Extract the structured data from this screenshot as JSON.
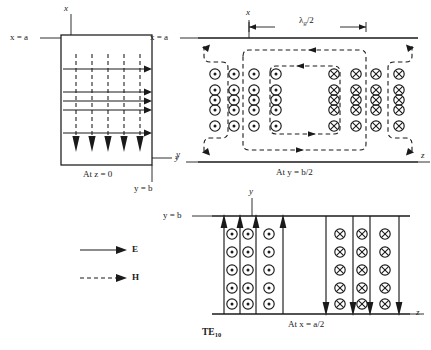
{
  "figure": {
    "mode_label": "TE",
    "mode_sub": "10",
    "legend": [
      {
        "symbol": "solid-arrow",
        "label": "E"
      },
      {
        "symbol": "dashed-arrow",
        "label": "H"
      }
    ]
  },
  "panels": [
    {
      "id": "panel-xy-z0",
      "caption_prefix": "At ",
      "caption_var": "z",
      "caption_eq": " = 0",
      "axis_top": "x",
      "axis_right": "y",
      "wall_label_var": "x",
      "wall_label_eq": " = a",
      "corner_label_var": "y",
      "corner_label_eq": " = b",
      "e_line_count": 5,
      "h_line_count": 5
    },
    {
      "id": "panel-xz-yhalf",
      "caption_prefix": "At ",
      "caption_var": "y",
      "caption_eq": " = b/2",
      "axis_top": "x",
      "axis_left": "y",
      "axis_right": "z",
      "wall_label_var": "x",
      "wall_label_eq": " = a",
      "dimension_label": "λ",
      "dimension_sub": "g",
      "dimension_suffix": "/2",
      "dot_columns": 4,
      "cross_columns": 4,
      "symbol_rows": 5
    },
    {
      "id": "panel-yz-xhalf",
      "caption_prefix": "At ",
      "caption_var": "x",
      "caption_eq": " = a/2",
      "axis_top": "y",
      "axis_right": "z",
      "wall_label_var": "y",
      "wall_label_eq": " = b",
      "dot_columns": 3,
      "cross_columns": 3,
      "symbol_rows": 5,
      "up_arrows": 4,
      "down_arrows": 4
    }
  ]
}
